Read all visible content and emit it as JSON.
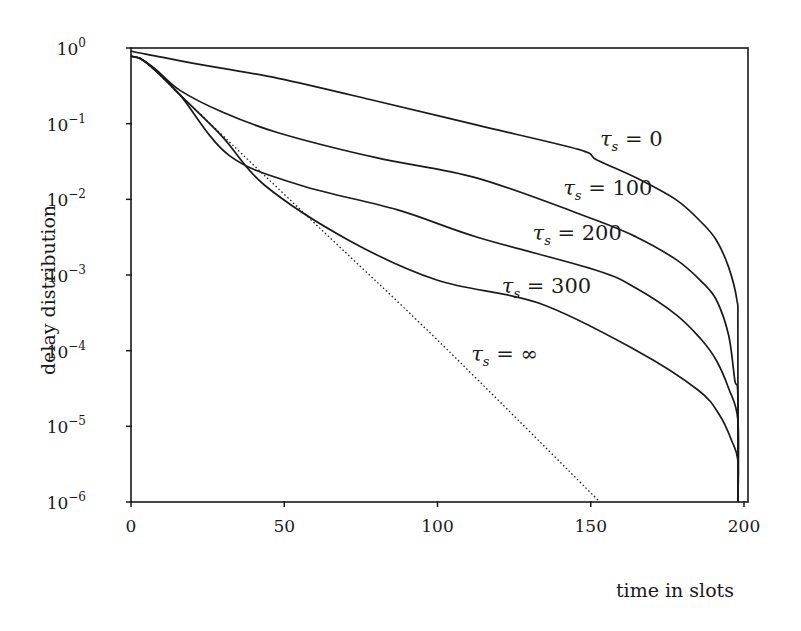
{
  "chart_data": {
    "type": "line",
    "title": "",
    "xlabel": "time in slots",
    "ylabel": "delay distribution",
    "xlim": [
      0,
      200
    ],
    "ylim": [
      1e-06,
      1
    ],
    "yscale": "log",
    "grid": false,
    "legend": "inline labels near curves",
    "x_ticks": [
      "0",
      "50",
      "100",
      "150",
      "200"
    ],
    "y_ticks": [
      {
        "base": "10",
        "exp": "0"
      },
      {
        "base": "10",
        "exp": "−1"
      },
      {
        "base": "10",
        "exp": "−2"
      },
      {
        "base": "10",
        "exp": "−3"
      },
      {
        "base": "10",
        "exp": "−4"
      },
      {
        "base": "10",
        "exp": "−5"
      },
      {
        "base": "10",
        "exp": "−6"
      }
    ],
    "series": [
      {
        "name": "τs = 0",
        "label_value": "0",
        "style": "solid",
        "x": [
          0,
          2,
          10,
          20,
          48,
          80,
          113,
          146,
          152,
          165,
          178,
          186,
          191,
          195,
          197.7,
          198,
          198
        ],
        "log10_y": [
          -0.04,
          -0.06,
          -0.12,
          -0.2,
          -0.4,
          -0.7,
          -1.02,
          -1.34,
          -1.48,
          -1.72,
          -2.01,
          -2.3,
          -2.54,
          -2.9,
          -3.33,
          -3.73,
          -6
        ]
      },
      {
        "name": "τs = 100",
        "label_value": "100",
        "style": "solid",
        "x": [
          0,
          3,
          8,
          16,
          30,
          48,
          80,
          113,
          152,
          165,
          178,
          186,
          191,
          195,
          197,
          198,
          198
        ],
        "log10_y": [
          -0.11,
          -0.14,
          -0.28,
          -0.56,
          -0.85,
          -1.12,
          -1.45,
          -1.72,
          -2.28,
          -2.5,
          -2.8,
          -3.08,
          -3.33,
          -3.8,
          -4.39,
          -4.6,
          -6
        ]
      },
      {
        "name": "τs = 200",
        "label_value": "200",
        "style": "solid",
        "x": [
          0,
          3,
          8,
          16,
          32,
          55,
          87,
          113,
          152,
          165,
          178,
          186,
          191,
          195,
          198,
          198
        ],
        "log10_y": [
          -0.11,
          -0.14,
          -0.3,
          -0.62,
          -1.42,
          -1.81,
          -2.14,
          -2.5,
          -2.94,
          -3.18,
          -3.53,
          -3.85,
          -4.13,
          -4.5,
          -4.92,
          -6
        ]
      },
      {
        "name": "τs = 300",
        "label_value": "300",
        "style": "solid",
        "x": [
          0,
          3,
          8,
          16,
          30,
          43.5,
          71,
          100,
          133,
          165,
          185,
          192,
          196,
          198,
          198
        ],
        "log10_y": [
          -0.11,
          -0.14,
          -0.3,
          -0.62,
          -1.18,
          -1.81,
          -2.54,
          -3.07,
          -3.37,
          -4.0,
          -4.52,
          -4.85,
          -5.19,
          -5.45,
          -6
        ]
      },
      {
        "name": "τs = ∞",
        "label_value": "∞",
        "style": "dotted",
        "x": [
          0,
          3,
          8,
          16,
          30,
          60,
          100,
          153
        ],
        "log10_y": [
          -0.11,
          -0.14,
          -0.3,
          -0.62,
          -1.16,
          -2.32,
          -3.86,
          -6
        ]
      }
    ],
    "annotations": [
      {
        "text": "τs = 0",
        "x": 153,
        "log10_y": -1.2
      },
      {
        "text": "τs = 100",
        "x": 141,
        "log10_y": -1.85
      },
      {
        "text": "τs = 200",
        "x": 131,
        "log10_y": -2.45
      },
      {
        "text": "τs = 300",
        "x": 121,
        "log10_y": -3.15
      },
      {
        "text": "τs = ∞",
        "x": 111,
        "log10_y": -4.05
      }
    ]
  },
  "labels": {
    "xlabel": "time in slots",
    "ylabel": "delay distribution",
    "tau_symbol": "τ",
    "tau_sub": "s",
    "equals": " = ",
    "curve_values": [
      "0",
      "100",
      "200",
      "300",
      "∞"
    ]
  }
}
